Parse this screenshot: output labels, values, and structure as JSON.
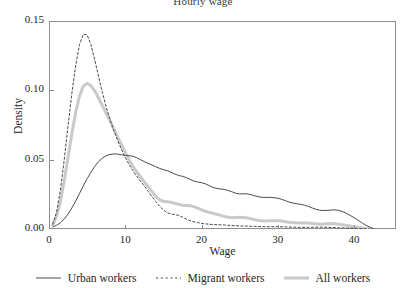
{
  "chart_data": {
    "type": "line",
    "title": "Hourly wage",
    "xlabel": "Wage",
    "ylabel": "Density",
    "xlim": [
      0,
      45.5
    ],
    "ylim": [
      0,
      0.15
    ],
    "xticks": [
      0,
      10,
      20,
      30,
      40
    ],
    "xticklabels": [
      "0",
      "10",
      "20",
      "30",
      "40"
    ],
    "yticks": [
      0.0,
      0.05,
      0.1,
      0.15
    ],
    "yticklabels": [
      "0.00",
      "0.05",
      "0.10",
      "0.15"
    ],
    "grid": false,
    "legend_position": "bottom",
    "series": [
      {
        "name": "Urban workers",
        "style": "solid-thin",
        "color": "#4a4a4a",
        "width": 1.0,
        "x": [
          0.5,
          1,
          1.5,
          2,
          2.5,
          3,
          3.5,
          4,
          4.5,
          5,
          5.5,
          6,
          6.5,
          7,
          7.5,
          8,
          8.5,
          9,
          9.5,
          10,
          10.5,
          11,
          11.5,
          12,
          12.5,
          13,
          13.5,
          14,
          14.5,
          15,
          15.5,
          16,
          16.5,
          17,
          17.5,
          18,
          18.5,
          19,
          19.5,
          20,
          20.5,
          21,
          21.5,
          22,
          22.5,
          23,
          23.5,
          24,
          24.5,
          25,
          25.5,
          26,
          26.5,
          27,
          27.5,
          28,
          28.5,
          29,
          29.5,
          30,
          30.5,
          31,
          31.5,
          32,
          32.5,
          33,
          33.5,
          34,
          34.5,
          35,
          35.5,
          36,
          36.5,
          37,
          37.5,
          38,
          38.5,
          39,
          39.5,
          40,
          40.5,
          41,
          41.5,
          42,
          42.5
        ],
        "y": [
          0.0015,
          0.0027,
          0.0045,
          0.0072,
          0.0108,
          0.0152,
          0.0202,
          0.0256,
          0.0311,
          0.0363,
          0.041,
          0.0452,
          0.0486,
          0.0511,
          0.0528,
          0.0538,
          0.0541,
          0.054,
          0.0535,
          0.0531,
          0.0529,
          0.0525,
          0.0514,
          0.05,
          0.0486,
          0.0473,
          0.0462,
          0.0449,
          0.0437,
          0.0428,
          0.0421,
          0.0409,
          0.0396,
          0.0386,
          0.038,
          0.0371,
          0.0358,
          0.0346,
          0.0339,
          0.0334,
          0.0326,
          0.0313,
          0.03,
          0.0292,
          0.0289,
          0.0285,
          0.0278,
          0.0268,
          0.0258,
          0.0253,
          0.0254,
          0.0253,
          0.0247,
          0.0239,
          0.0232,
          0.0228,
          0.0228,
          0.0228,
          0.0226,
          0.0222,
          0.0214,
          0.0204,
          0.0194,
          0.0187,
          0.0182,
          0.0178,
          0.0172,
          0.0163,
          0.0152,
          0.0142,
          0.0135,
          0.0133,
          0.0134,
          0.0137,
          0.0138,
          0.0134,
          0.0125,
          0.0113,
          0.0098,
          0.0082,
          0.0064,
          0.0046,
          0.0029,
          0.0015,
          0.0005
        ]
      },
      {
        "name": "Migrant workers",
        "style": "dashed",
        "color": "#4a4a4a",
        "width": 1.0,
        "x": [
          0.5,
          1,
          1.5,
          2,
          2.5,
          3,
          3.5,
          4,
          4.5,
          5,
          5.5,
          6,
          6.5,
          7,
          7.5,
          8,
          8.5,
          9,
          9.5,
          10,
          10.5,
          11,
          11.5,
          12,
          12.5,
          13,
          13.5,
          14,
          14.5,
          15,
          15.5,
          16,
          16.5,
          17,
          17.5,
          18,
          18.5,
          19,
          19.5,
          20,
          21,
          22,
          23,
          24,
          25,
          26,
          27,
          28,
          29,
          30,
          31,
          32,
          33,
          34,
          35,
          36,
          37,
          38,
          39,
          40,
          41,
          42
        ],
        "y": [
          0.0035,
          0.0122,
          0.0281,
          0.05,
          0.0745,
          0.098,
          0.118,
          0.133,
          0.1405,
          0.14,
          0.133,
          0.122,
          0.11,
          0.0985,
          0.088,
          0.079,
          0.071,
          0.064,
          0.0575,
          0.0515,
          0.0465,
          0.042,
          0.0382,
          0.0345,
          0.031,
          0.0272,
          0.0235,
          0.0198,
          0.0165,
          0.0138,
          0.0118,
          0.0108,
          0.0104,
          0.0098,
          0.0086,
          0.0072,
          0.006,
          0.0052,
          0.0046,
          0.004,
          0.0034,
          0.0031,
          0.0029,
          0.0025,
          0.0022,
          0.0021,
          0.0019,
          0.0017,
          0.0016,
          0.0017,
          0.0015,
          0.0013,
          0.0012,
          0.0012,
          0.0013,
          0.0013,
          0.0011,
          0.0009,
          0.0007,
          0.0005,
          0.0003,
          0.0001
        ]
      },
      {
        "name": "All workers",
        "style": "solid-thick",
        "color": "#c9c9c9",
        "width": 3.0,
        "x": [
          0.5,
          1,
          1.5,
          2,
          2.5,
          3,
          3.5,
          4,
          4.5,
          5,
          5.5,
          6,
          6.5,
          7,
          7.5,
          8,
          8.5,
          9,
          9.5,
          10,
          10.5,
          11,
          11.5,
          12,
          12.5,
          13,
          13.5,
          14,
          14.5,
          15,
          15.5,
          16,
          16.5,
          17,
          17.5,
          18,
          18.5,
          19,
          19.5,
          20,
          20.5,
          21,
          21.5,
          22,
          22.5,
          23,
          23.5,
          24,
          24.5,
          25,
          25.5,
          26,
          26.5,
          27,
          27.5,
          28,
          28.5,
          29,
          29.5,
          30,
          30.5,
          31,
          31.5,
          32,
          32.5,
          33,
          33.5,
          34,
          34.5,
          35,
          35.5,
          36,
          36.5,
          37,
          37.5,
          38,
          38.5,
          39,
          39.5,
          40,
          40.5,
          41,
          41.5,
          42
        ],
        "y": [
          0.0032,
          0.0092,
          0.02,
          0.035,
          0.052,
          0.069,
          0.084,
          0.096,
          0.103,
          0.105,
          0.1035,
          0.0995,
          0.0945,
          0.089,
          0.0835,
          0.078,
          0.0722,
          0.0665,
          0.0608,
          0.0552,
          0.05,
          0.0452,
          0.0412,
          0.0375,
          0.034,
          0.0305,
          0.027,
          0.0237,
          0.0212,
          0.02,
          0.0197,
          0.0193,
          0.0186,
          0.0178,
          0.0172,
          0.017,
          0.0168,
          0.0161,
          0.015,
          0.0138,
          0.0128,
          0.012,
          0.0113,
          0.0106,
          0.0098,
          0.009,
          0.0085,
          0.0082,
          0.0083,
          0.0084,
          0.0083,
          0.0079,
          0.0073,
          0.0067,
          0.0062,
          0.0059,
          0.0058,
          0.0059,
          0.006,
          0.006,
          0.0057,
          0.0053,
          0.0049,
          0.0046,
          0.0044,
          0.0044,
          0.0044,
          0.0043,
          0.004,
          0.0037,
          0.0035,
          0.0036,
          0.0038,
          0.0039,
          0.0038,
          0.0035,
          0.0031,
          0.0026,
          0.0021,
          0.0016,
          0.0011,
          0.0007,
          0.0004,
          0.0002
        ]
      }
    ]
  },
  "legend": {
    "items": [
      {
        "label": "Urban workers",
        "swatch": "solid-thin-line-icon"
      },
      {
        "label": "Migrant workers",
        "swatch": "dashed-line-icon"
      },
      {
        "label": "All workers",
        "swatch": "thick-gray-line-icon"
      }
    ]
  }
}
